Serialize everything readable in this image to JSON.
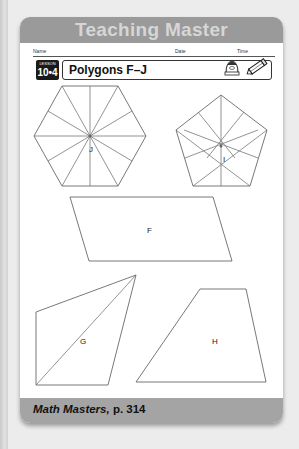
{
  "header": {
    "title": "Teaching Master"
  },
  "form_line": {
    "name_label": "Name",
    "date_label": "Date",
    "time_label": "Time"
  },
  "lesson": {
    "label": "LESSON",
    "number": "10•4"
  },
  "title": "Polygons F–J",
  "icons": [
    "student-icon",
    "pencil-icon"
  ],
  "shapes": {
    "J": {
      "label": "J",
      "type": "hexagon",
      "divisions": 12
    },
    "I": {
      "label": "I",
      "type": "pentagon",
      "divisions": 10
    },
    "F": {
      "label": "F",
      "type": "parallelogram"
    },
    "G": {
      "label": "G",
      "type": "quadrilateral-with-diagonal"
    },
    "H": {
      "label": "H",
      "type": "trapezoid"
    }
  },
  "footer": {
    "book": "Math Masters,",
    "page": " p. 314"
  },
  "colors": {
    "header_band": "#9a9a9a",
    "header_text": "#d6d6d6",
    "footer_band": "#a4a4a4",
    "background": "#ececec"
  }
}
